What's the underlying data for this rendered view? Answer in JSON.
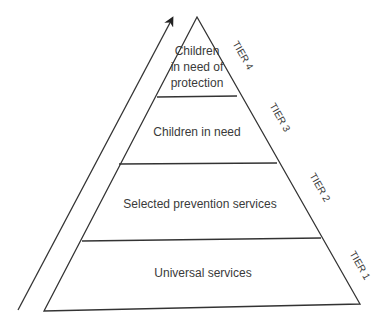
{
  "diagram": {
    "type": "tiered-pyramid",
    "arrow": {
      "direction": "up",
      "meaning": "increasing need"
    },
    "tiers": [
      {
        "id": "tier-4",
        "tier_label": "TIER 4",
        "lines": [
          "Children",
          "in need of",
          "protection"
        ]
      },
      {
        "id": "tier-3",
        "tier_label": "TIER 3",
        "lines": [
          "Children in need"
        ]
      },
      {
        "id": "tier-2",
        "tier_label": "TIER 2",
        "lines": [
          "Selected prevention services"
        ]
      },
      {
        "id": "tier-1",
        "tier_label": "TIER 1",
        "lines": [
          "Universal services"
        ]
      }
    ]
  },
  "colors": {
    "line": "#333333",
    "text": "#3a3a3a",
    "background": "#ffffff"
  }
}
